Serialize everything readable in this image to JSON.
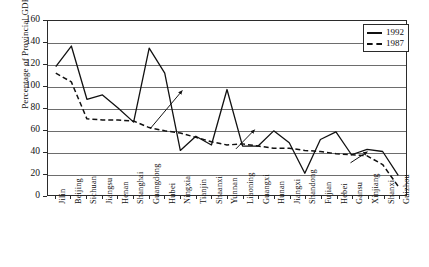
{
  "chart_data": {
    "type": "line",
    "title": "",
    "xlabel": "",
    "ylabel": "Percentage of Provincial GDP",
    "ylim": [
      0,
      160
    ],
    "ytick_step": 20,
    "yticks": [
      "0",
      "20",
      "40",
      "60",
      "80",
      "100",
      "120",
      "140",
      "160"
    ],
    "grid": true,
    "legend_position": "top-right",
    "categories": [
      "Jilin",
      "Beijing",
      "Sichuan",
      "Jiangsu",
      "Henan",
      "Shanghai",
      "Guangdong",
      "Hubei",
      "Ningxia",
      "Tianjin",
      "Shaanxi",
      "Yunnan",
      "Liaoning",
      "Guangxi",
      "Hunan",
      "Jiangxi",
      "Shandong",
      "Fujian",
      "Hebei",
      "Gansu",
      "Xinjiang",
      "Shanxi",
      "Guizhou"
    ],
    "series": [
      {
        "name": "1992",
        "style": "solid",
        "values": [
          118,
          137,
          88,
          92,
          80,
          67,
          135,
          112,
          41,
          54,
          46,
          97,
          45,
          45,
          59,
          48,
          20,
          51,
          58,
          37,
          42,
          40,
          18
        ]
      },
      {
        "name": "1987",
        "style": "dashed",
        "values": [
          112,
          104,
          70,
          69,
          69,
          68,
          62,
          59,
          57,
          53,
          49,
          46,
          47,
          45,
          43,
          43,
          41,
          40,
          38,
          37,
          36,
          28,
          8
        ]
      }
    ],
    "annotations": [
      {
        "name": "arrow-guangdong",
        "x1": 0.285,
        "y1": 0.62,
        "x2": 0.375,
        "y2": 0.4
      },
      {
        "name": "arrow-yunnan",
        "x1": 0.525,
        "y1": 0.735,
        "x2": 0.577,
        "y2": 0.625
      },
      {
        "name": "arrow-hebei",
        "x1": 0.845,
        "y1": 0.815,
        "x2": 0.892,
        "y2": 0.752
      }
    ]
  },
  "legend": {
    "items": [
      {
        "label": "1992",
        "style": "solid"
      },
      {
        "label": "1987",
        "style": "dashed"
      }
    ]
  }
}
